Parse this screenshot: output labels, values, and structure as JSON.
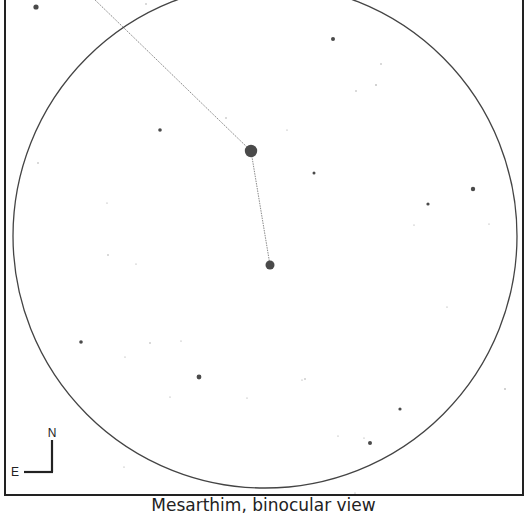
{
  "title": "Mesarthim, binocular view",
  "frame": {
    "x": 5,
    "y": -4,
    "width": 518,
    "height": 499,
    "stroke": "#222222"
  },
  "field_of_view": {
    "cx": 265,
    "cy": 236,
    "r": 252,
    "stroke": "#444444"
  },
  "compass": {
    "north_label": "N",
    "east_label": "E",
    "corner": {
      "x": 52,
      "y": 472
    },
    "north_len": 32,
    "east_len": 28
  },
  "asterism_lines": [
    {
      "x1": 93,
      "y1": -2,
      "x2": 251,
      "y2": 151
    },
    {
      "x1": 251,
      "y1": 151,
      "x2": 270,
      "y2": 265
    }
  ],
  "stars": [
    {
      "x": 251,
      "y": 151,
      "r": 6.2,
      "label": "bright-star-primary"
    },
    {
      "x": 270,
      "y": 265,
      "r": 4.5,
      "label": "bright-star-secondary"
    },
    {
      "x": 36,
      "y": 7,
      "r": 2.6
    },
    {
      "x": 333,
      "y": 39,
      "r": 2.0
    },
    {
      "x": 160,
      "y": 130,
      "r": 1.8
    },
    {
      "x": 473,
      "y": 189,
      "r": 2.2
    },
    {
      "x": 428,
      "y": 204,
      "r": 1.6
    },
    {
      "x": 314,
      "y": 173,
      "r": 1.5
    },
    {
      "x": 81,
      "y": 342,
      "r": 1.8
    },
    {
      "x": 199,
      "y": 377,
      "r": 2.4
    },
    {
      "x": 400,
      "y": 409,
      "r": 1.6
    },
    {
      "x": 370,
      "y": 443,
      "r": 2.0
    },
    {
      "x": 376,
      "y": 85,
      "r": 0.8
    },
    {
      "x": 146,
      "y": 4,
      "r": 0.7
    },
    {
      "x": 226,
      "y": 118,
      "r": 0.7
    },
    {
      "x": 356,
      "y": 91,
      "r": 0.7
    },
    {
      "x": 381,
      "y": 64,
      "r": 0.7
    },
    {
      "x": 287,
      "y": 130,
      "r": 0.6
    },
    {
      "x": 38,
      "y": 163,
      "r": 0.7
    },
    {
      "x": 107,
      "y": 203,
      "r": 0.6
    },
    {
      "x": 108,
      "y": 255,
      "r": 0.7
    },
    {
      "x": 136,
      "y": 264,
      "r": 0.6
    },
    {
      "x": 414,
      "y": 225,
      "r": 0.6
    },
    {
      "x": 489,
      "y": 224,
      "r": 0.6
    },
    {
      "x": 505,
      "y": 389,
      "r": 0.8
    },
    {
      "x": 170,
      "y": 397,
      "r": 0.6
    },
    {
      "x": 247,
      "y": 398,
      "r": 0.6
    },
    {
      "x": 305,
      "y": 379,
      "r": 0.7
    },
    {
      "x": 364,
      "y": 438,
      "r": 0.6
    },
    {
      "x": 124,
      "y": 467,
      "r": 0.6
    },
    {
      "x": 338,
      "y": 436,
      "r": 0.6
    },
    {
      "x": 447,
      "y": 307,
      "r": 0.6
    },
    {
      "x": 302,
      "y": 380,
      "r": 0.6
    },
    {
      "x": 150,
      "y": 343,
      "r": 0.7
    },
    {
      "x": 125,
      "y": 357,
      "r": 0.6
    },
    {
      "x": 181,
      "y": 341,
      "r": 0.6
    },
    {
      "x": 355,
      "y": 493,
      "r": 0.6
    }
  ],
  "colors": {
    "star": "#4a4a4a",
    "line": "#8a8a8a",
    "text": "#222222"
  }
}
